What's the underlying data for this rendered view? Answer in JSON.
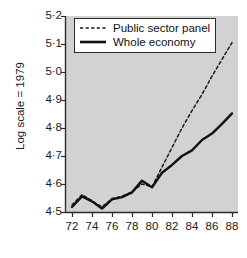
{
  "chart_data": {
    "type": "line",
    "title": "",
    "subtitle": "",
    "xlabel": "",
    "ylabel": "Log scale = 1979",
    "xlim": [
      1971.3,
      1988.6
    ],
    "ylim": [
      4.5,
      5.2
    ],
    "grid": false,
    "legend_position": "top-left",
    "x_tick_labels": [
      "72",
      "74",
      "76",
      "78",
      "80",
      "82",
      "84",
      "86",
      "88"
    ],
    "x_tick_values": [
      1972,
      1974,
      1976,
      1978,
      1980,
      1982,
      1984,
      1986,
      1988
    ],
    "y_tick_labels": [
      "5·2",
      "5·1",
      "5·0",
      "4·9",
      "4·8",
      "4·7",
      "4·6",
      "4·5"
    ],
    "y_tick_values": [
      5.2,
      5.1,
      5.0,
      4.9,
      4.8,
      4.7,
      4.6,
      4.5
    ],
    "x": [
      1972,
      1973,
      1974,
      1975,
      1976,
      1977,
      1978,
      1979,
      1980,
      1981,
      1982,
      1983,
      1984,
      1985,
      1986,
      1987,
      1988
    ],
    "series": [
      {
        "name": "Public sector panel",
        "style": "dashed",
        "color": "#1a1a1a",
        "x": [
          1972,
          1973,
          1974,
          1975,
          1976,
          1977,
          1978,
          1979,
          1980,
          1981,
          1982,
          1983,
          1984,
          1985,
          1986,
          1987,
          1988
        ],
        "values": [
          4.525,
          4.562,
          4.54,
          4.518,
          4.548,
          4.556,
          4.572,
          4.6,
          4.59,
          4.66,
          4.73,
          4.8,
          4.862,
          4.92,
          4.985,
          5.045,
          5.105
        ]
      },
      {
        "name": "Whole economy",
        "style": "solid",
        "color": "#111111",
        "x": [
          1972,
          1973,
          1974,
          1975,
          1976,
          1977,
          1978,
          1979,
          1980,
          1981,
          1982,
          1983,
          1984,
          1985,
          1986,
          1987,
          1988
        ],
        "values": [
          4.518,
          4.556,
          4.538,
          4.512,
          4.545,
          4.553,
          4.57,
          4.612,
          4.588,
          4.64,
          4.668,
          4.7,
          4.72,
          4.757,
          4.78,
          4.815,
          4.852
        ]
      }
    ],
    "legend_entries": [
      {
        "label": "Public sector panel",
        "style": "dashed"
      },
      {
        "label": "Whole economy",
        "style": "solid"
      }
    ],
    "colors": {
      "plot_background": "#d2d2d2",
      "page_background": "#ffffff",
      "axis": "#2b2b2b",
      "series_public": "#1a1a1a",
      "series_whole": "#111111",
      "legend_background": "#ffffff"
    }
  }
}
